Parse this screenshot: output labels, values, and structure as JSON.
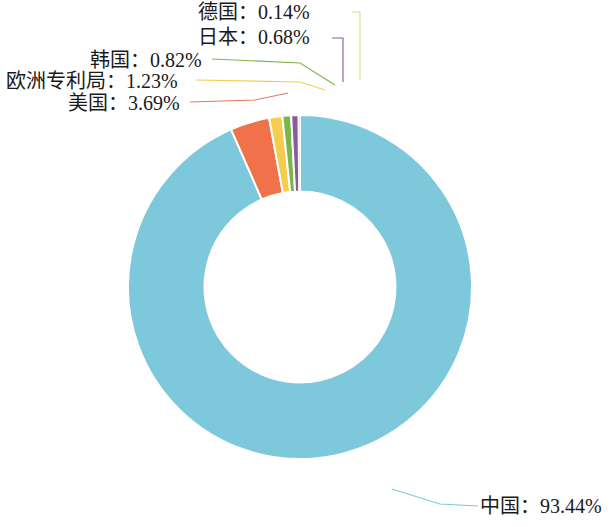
{
  "chart_data": {
    "type": "pie",
    "title": "",
    "subtitle": "",
    "xlabel": "",
    "ylabel": "",
    "legend_position": "none",
    "grid": false,
    "donut": true,
    "inner_radius_ratio": 0.555,
    "start_angle_deg": 0,
    "direction": "counterclockwise",
    "units": "%",
    "categories": [
      "中国",
      "美国",
      "欧洲专利局",
      "韩国",
      "日本",
      "德国"
    ],
    "values": [
      93.44,
      3.69,
      1.23,
      0.82,
      0.68,
      0.14
    ],
    "labels": [
      "中国：93.44%",
      "美国：3.69%",
      "欧洲专利局：1.23%",
      "韩国：0.82%",
      "日本：0.68%",
      "德国：0.14%"
    ],
    "colors": [
      "#7ec8dc",
      "#f0724a",
      "#f5cd4e",
      "#7ab648",
      "#8a5a9c",
      "#cfe08a"
    ],
    "series": [
      {
        "name": "占比",
        "values": [
          93.44,
          3.69,
          1.23,
          0.82,
          0.68,
          0.14
        ]
      }
    ],
    "slices": [
      {
        "name": "中国",
        "value": 93.44,
        "label": "中国：93.44%",
        "color": "#7ec8dc"
      },
      {
        "name": "美国",
        "value": 3.69,
        "label": "美国：3.69%",
        "color": "#f0724a"
      },
      {
        "name": "欧洲专利局",
        "value": 1.23,
        "label": "欧洲专利局：1.23%",
        "color": "#f5cd4e"
      },
      {
        "name": "韩国",
        "value": 0.82,
        "label": "韩国：0.82%",
        "color": "#7ab648"
      },
      {
        "name": "日本",
        "value": 0.68,
        "label": "日本：0.68%",
        "color": "#8a5a9c"
      },
      {
        "name": "德国",
        "value": 0.14,
        "label": "德国：0.14%",
        "color": "#cfe08a"
      }
    ]
  },
  "callouts": {
    "germany": "德国：0.14%",
    "japan": "日本：0.68%",
    "korea": "韩国：0.82%",
    "epo": "欧洲专利局：1.23%",
    "usa": "美国：3.69%",
    "china": "中国：93.44%"
  },
  "colors": {
    "china": "#7ec8dc",
    "usa": "#f0724a",
    "epo": "#f5cd4e",
    "korea": "#7ab648",
    "japan": "#8a5a9c",
    "germany": "#cfe08a",
    "text": "#1a1a1a",
    "background": "#ffffff"
  }
}
